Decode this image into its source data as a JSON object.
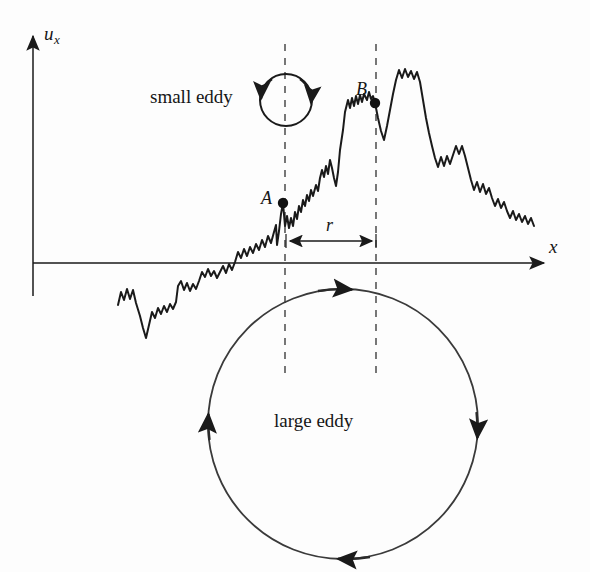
{
  "figure": {
    "domain": "scientific-diagram",
    "title_visible": false,
    "background_color": "#fdfdfd",
    "ink_color": "#1a1a1a"
  },
  "axes": {
    "y_label": "u",
    "y_label_subscript": "x",
    "x_label": "x",
    "origin": {
      "x": 33,
      "y": 263
    },
    "x_axis": {
      "x_start": 33,
      "x_end": 548,
      "y": 263,
      "arrow": "right"
    },
    "y_axis": {
      "x": 33,
      "y_start": 30,
      "y_end": 296,
      "arrow": "up"
    }
  },
  "labels": {
    "small_eddy": "small eddy",
    "large_eddy": "large eddy",
    "point_a": "A",
    "point_b": "B",
    "separation": "r"
  },
  "markers": [
    {
      "name": "A",
      "x": 283,
      "y": 203
    },
    {
      "name": "B",
      "x": 375,
      "y": 103
    }
  ],
  "separation_arrow": {
    "label": "r",
    "x_start": 286,
    "x_end": 376,
    "y": 241,
    "heads": "both"
  },
  "dashed_lines": [
    {
      "name": "line-through-A",
      "x": 285,
      "y_top": 44,
      "y_bottom": 377
    },
    {
      "name": "line-through-B",
      "x": 376,
      "y_top": 44,
      "y_bottom": 377
    }
  ],
  "eddies": [
    {
      "name": "small-eddy",
      "label": "small eddy",
      "center_x": 286,
      "center_y": 100,
      "radius": 26,
      "rotation": "clockwise",
      "arrow_count": 2
    },
    {
      "name": "large-eddy",
      "label": "large eddy",
      "center_x": 343,
      "center_y": 424,
      "radius": 135,
      "rotation": "clockwise",
      "arrow_count": 4
    }
  ],
  "chart_data": {
    "type": "line",
    "title": "",
    "xlabel": "x",
    "ylabel": "u_x",
    "grid": false,
    "legend": null,
    "series": [
      {
        "name": "turbulent velocity signal",
        "points_px": [
          [
            118,
            305
          ],
          [
            121,
            292
          ],
          [
            124,
            300
          ],
          [
            127,
            289
          ],
          [
            130,
            299
          ],
          [
            133,
            290
          ],
          [
            136,
            303
          ],
          [
            140,
            316
          ],
          [
            143,
            328
          ],
          [
            146,
            338
          ],
          [
            149,
            325
          ],
          [
            152,
            312
          ],
          [
            155,
            318
          ],
          [
            158,
            308
          ],
          [
            161,
            314
          ],
          [
            164,
            306
          ],
          [
            167,
            312
          ],
          [
            170,
            304
          ],
          [
            173,
            309
          ],
          [
            176,
            302
          ],
          [
            178,
            286
          ],
          [
            181,
            281
          ],
          [
            184,
            290
          ],
          [
            187,
            283
          ],
          [
            190,
            291
          ],
          [
            193,
            284
          ],
          [
            196,
            289
          ],
          [
            199,
            281
          ],
          [
            202,
            272
          ],
          [
            205,
            277
          ],
          [
            208,
            269
          ],
          [
            211,
            276
          ],
          [
            214,
            271
          ],
          [
            217,
            278
          ],
          [
            220,
            272
          ],
          [
            223,
            266
          ],
          [
            226,
            273
          ],
          [
            229,
            264
          ],
          [
            232,
            270
          ],
          [
            235,
            262
          ],
          [
            238,
            252
          ],
          [
            241,
            258
          ],
          [
            244,
            249
          ],
          [
            247,
            256
          ],
          [
            250,
            247
          ],
          [
            253,
            253
          ],
          [
            256,
            244
          ],
          [
            259,
            250
          ],
          [
            262,
            240
          ],
          [
            265,
            247
          ],
          [
            268,
            236
          ],
          [
            271,
            243
          ],
          [
            274,
            232
          ],
          [
            276,
            225
          ],
          [
            277,
            245
          ],
          [
            279,
            231
          ],
          [
            281,
            214
          ],
          [
            283,
            203
          ],
          [
            285,
            226
          ],
          [
            287,
            216
          ],
          [
            289,
            228
          ],
          [
            291,
            218
          ],
          [
            293,
            226
          ],
          [
            295,
            212
          ],
          [
            297,
            219
          ],
          [
            299,
            206
          ],
          [
            301,
            212
          ],
          [
            303,
            200
          ],
          [
            305,
            206
          ],
          [
            307,
            195
          ],
          [
            309,
            201
          ],
          [
            311,
            190
          ],
          [
            313,
            196
          ],
          [
            316,
            185
          ],
          [
            318,
            191
          ],
          [
            320,
            178
          ],
          [
            322,
            170
          ],
          [
            324,
            177
          ],
          [
            326,
            166
          ],
          [
            328,
            174
          ],
          [
            330,
            160
          ],
          [
            332,
            168
          ],
          [
            334,
            178
          ],
          [
            336,
            186
          ],
          [
            338,
            172
          ],
          [
            340,
            150
          ],
          [
            343,
            130
          ],
          [
            345,
            112
          ],
          [
            348,
            100
          ],
          [
            350,
            108
          ],
          [
            352,
            98
          ],
          [
            354,
            106
          ],
          [
            356,
            96
          ],
          [
            358,
            104
          ],
          [
            360,
            95
          ],
          [
            362,
            102
          ],
          [
            364,
            94
          ],
          [
            367,
            100
          ],
          [
            369,
            92
          ],
          [
            371,
            99
          ],
          [
            373,
            96
          ],
          [
            375,
            103
          ],
          [
            378,
            118
          ],
          [
            381,
            131
          ],
          [
            384,
            140
          ],
          [
            387,
            126
          ],
          [
            390,
            110
          ],
          [
            393,
            94
          ],
          [
            396,
            80
          ],
          [
            399,
            70
          ],
          [
            402,
            78
          ],
          [
            405,
            69
          ],
          [
            408,
            77
          ],
          [
            411,
            71
          ],
          [
            414,
            79
          ],
          [
            417,
            72
          ],
          [
            420,
            82
          ],
          [
            423,
            100
          ],
          [
            426,
            118
          ],
          [
            429,
            133
          ],
          [
            432,
            146
          ],
          [
            435,
            158
          ],
          [
            438,
            167
          ],
          [
            441,
            157
          ],
          [
            444,
            166
          ],
          [
            447,
            156
          ],
          [
            450,
            164
          ],
          [
            453,
            155
          ],
          [
            456,
            146
          ],
          [
            459,
            154
          ],
          [
            462,
            146
          ],
          [
            465,
            156
          ],
          [
            468,
            168
          ],
          [
            471,
            180
          ],
          [
            474,
            190
          ],
          [
            477,
            182
          ],
          [
            480,
            192
          ],
          [
            483,
            184
          ],
          [
            486,
            194
          ],
          [
            489,
            188
          ],
          [
            492,
            198
          ],
          [
            495,
            206
          ],
          [
            498,
            199
          ],
          [
            501,
            208
          ],
          [
            504,
            202
          ],
          [
            507,
            211
          ],
          [
            510,
            218
          ],
          [
            513,
            211
          ],
          [
            516,
            220
          ],
          [
            519,
            214
          ],
          [
            522,
            222
          ],
          [
            525,
            216
          ],
          [
            528,
            224
          ],
          [
            531,
            218
          ],
          [
            534,
            226
          ]
        ]
      }
    ]
  }
}
